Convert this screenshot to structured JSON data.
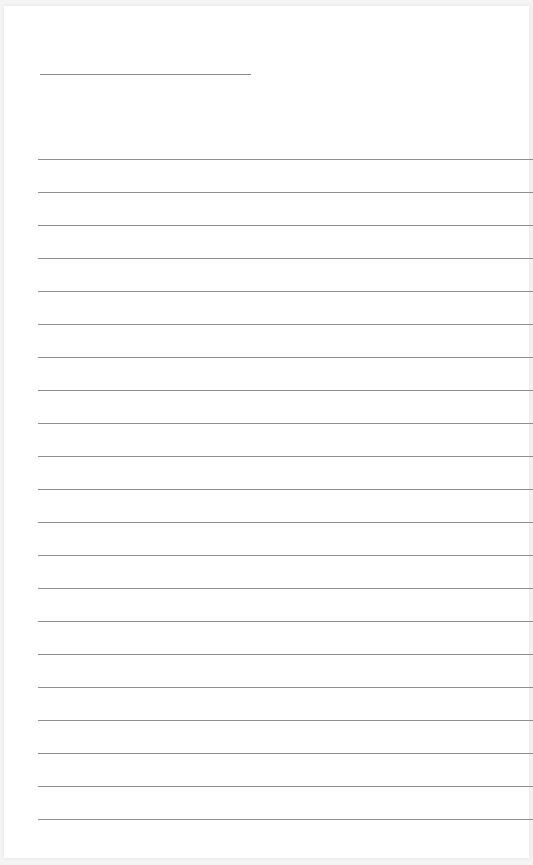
{
  "document": {
    "type": "lined-notepad-page",
    "title_text": "",
    "line_count": 21,
    "lines": [
      "",
      "",
      "",
      "",
      "",
      "",
      "",
      "",
      "",
      "",
      "",
      "",
      "",
      "",
      "",
      "",
      "",
      "",
      "",
      "",
      ""
    ]
  },
  "colors": {
    "rule": "#8f8f8f",
    "paper": "#ffffff",
    "background": "#f4f4f4"
  }
}
